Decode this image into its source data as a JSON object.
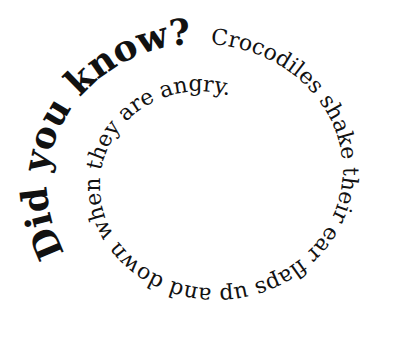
{
  "graphic": {
    "type": "spiral-text",
    "colors": {
      "background": "#ffffff",
      "text": "#111111"
    },
    "segments": [
      {
        "text": "Did you know?",
        "weight": "bold",
        "size": 36
      },
      {
        "text": "Crocodiles shake their ear flaps up and down when they are angry.",
        "weight": "normal",
        "size": 22
      }
    ]
  }
}
